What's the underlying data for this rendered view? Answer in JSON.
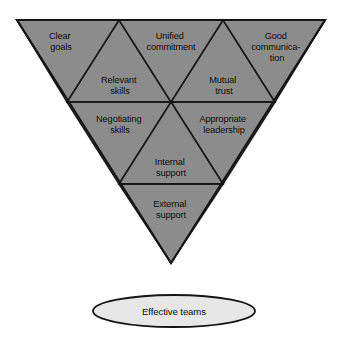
{
  "diagram": {
    "type": "inverted-triangle-hierarchy",
    "shape_colors": {
      "triangle_fill": "#8c8c8c",
      "triangle_stroke": "#141414",
      "ellipse_fill": "#e7e7e7",
      "ellipse_stroke": "#141414",
      "text": "#0d0d0d",
      "background": "#ffffff"
    },
    "cells": [
      {
        "id": "clear-goals",
        "orientation": "down",
        "row": 1,
        "column": 1,
        "lines": [
          "Clear",
          "goals"
        ]
      },
      {
        "id": "relevant-skills",
        "orientation": "up",
        "row": 1,
        "column": 2,
        "lines": [
          "Relevant",
          "skills"
        ]
      },
      {
        "id": "unified-commitment",
        "orientation": "down",
        "row": 1,
        "column": 3,
        "lines": [
          "Unified",
          "commitment"
        ]
      },
      {
        "id": "mutual-trust",
        "orientation": "up",
        "row": 1,
        "column": 4,
        "lines": [
          "Mutual",
          "trust"
        ]
      },
      {
        "id": "good-communication",
        "orientation": "down",
        "row": 1,
        "column": 5,
        "lines": [
          "Good",
          "communica-",
          "tion"
        ]
      },
      {
        "id": "negotiating-skills",
        "orientation": "down",
        "row": 2,
        "column": 1,
        "lines": [
          "Negotiating",
          "skills"
        ]
      },
      {
        "id": "internal-support",
        "orientation": "up",
        "row": 2,
        "column": 2,
        "lines": [
          "Internal",
          "support"
        ]
      },
      {
        "id": "appropriate-leadership",
        "orientation": "down",
        "row": 2,
        "column": 3,
        "lines": [
          "Appropriate",
          "leadership"
        ]
      },
      {
        "id": "external-support",
        "orientation": "down",
        "row": 3,
        "column": 1,
        "lines": [
          "External",
          "support"
        ]
      }
    ],
    "outcome": {
      "id": "effective-teams",
      "label": "Effective teams"
    }
  }
}
